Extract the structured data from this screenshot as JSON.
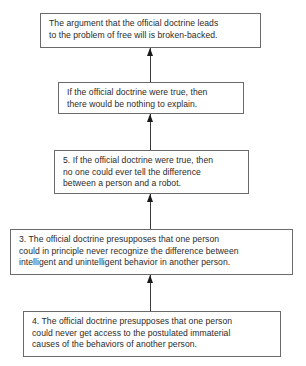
{
  "diagram": {
    "type": "argument-map",
    "direction": "bottom-to-top",
    "nodes": [
      {
        "id": "conclusion",
        "text": "The argument that the official doctrine leads\nto the problem of free will is broken-backed."
      },
      {
        "id": "premise-a",
        "text": "If the official doctrine were true, then\nthere would be nothing to explain."
      },
      {
        "id": "premise-5",
        "text": "5. If the official doctrine were true, then\nno one could ever tell the difference\nbetween a person and a robot."
      },
      {
        "id": "premise-3",
        "text": "3. The official doctrine presupposes that one person\ncould in principle never recognize the difference between\nintelligent and unintelligent behavior in another person."
      },
      {
        "id": "premise-4",
        "text": "4. The official doctrine presupposes that one person\ncould never get access to the postulated immaterial\ncauses of the behaviors of another person."
      }
    ],
    "edges": [
      {
        "from": "premise-a",
        "to": "conclusion"
      },
      {
        "from": "premise-5",
        "to": "premise-a"
      },
      {
        "from": "premise-3",
        "to": "premise-5"
      },
      {
        "from": "premise-4",
        "to": "premise-3"
      }
    ]
  }
}
